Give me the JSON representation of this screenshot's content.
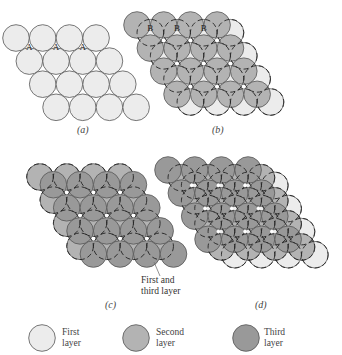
{
  "colors": {
    "first_layer": "#ececec",
    "second_layer": "#b3b3b3",
    "third_layer": "#999999",
    "outline": "#555555",
    "dash": "#222222"
  },
  "panels": [
    {
      "id": "a",
      "label": "(a)",
      "layers": [
        "first"
      ],
      "site_markers": [
        "A",
        "A",
        "A"
      ]
    },
    {
      "id": "b",
      "label": "(b)",
      "layers": [
        "first",
        "second"
      ],
      "site_markers": [
        "B",
        "B",
        "B",
        "C",
        "C",
        "C"
      ]
    },
    {
      "id": "c",
      "label": "(c)",
      "layers": [
        "second",
        "first-and-third"
      ],
      "annotation": "First and\nthird layer"
    },
    {
      "id": "d",
      "label": "(d)",
      "layers": [
        "first",
        "second",
        "third"
      ]
    }
  ],
  "annotation": {
    "line1": "First and",
    "line2": "third layer"
  },
  "legend": [
    {
      "line1": "First",
      "line2": "layer",
      "layer": "first"
    },
    {
      "line1": "Second",
      "line2": "layer",
      "layer": "second"
    },
    {
      "line1": "Third",
      "line2": "layer",
      "layer": "third"
    }
  ]
}
